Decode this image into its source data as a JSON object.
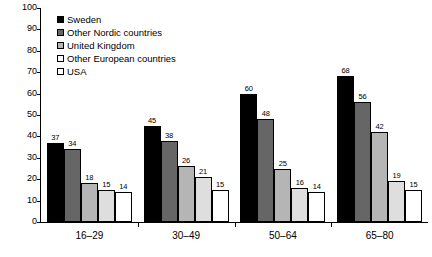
{
  "chart_data": {
    "type": "bar",
    "title": "",
    "subtitle": "",
    "xlabel": "",
    "ylabel": "",
    "ylim": [
      0,
      100
    ],
    "y_ticks": [
      0,
      10,
      20,
      30,
      40,
      50,
      60,
      70,
      80,
      90,
      100
    ],
    "grid": false,
    "legend_position": "top-left",
    "categories": [
      "16–29",
      "30–49",
      "50–64",
      "65–80"
    ],
    "series": [
      {
        "name": "Sweden",
        "color": "#000000",
        "values": [
          37,
          45,
          60,
          68
        ]
      },
      {
        "name": "Other Nordic countries",
        "color": "#666666",
        "values": [
          34,
          38,
          48,
          56
        ]
      },
      {
        "name": "United Kingdom",
        "color": "#b5b5b5",
        "values": [
          18,
          26,
          25,
          42
        ]
      },
      {
        "name": "Other European countries",
        "color": "#dedede",
        "values": [
          15,
          21,
          16,
          19
        ]
      },
      {
        "name": "USA",
        "color": "#ffffff",
        "values": [
          14,
          15,
          14,
          15
        ]
      }
    ]
  },
  "axes": {
    "y_tick_labels": [
      "100",
      "90",
      "80",
      "70",
      "60",
      "50",
      "40",
      "30",
      "20",
      "10",
      "0"
    ],
    "x_tick_labels": [
      "16–29",
      "30–49",
      "50–64",
      "65–80"
    ]
  },
  "legend": {
    "items": [
      {
        "label": "Sweden",
        "color": "#000000"
      },
      {
        "label": "Other Nordic countries",
        "color": "#666666"
      },
      {
        "label": "United Kingdom",
        "color": "#b5b5b5"
      },
      {
        "label": "Other European countries",
        "color": "#ffffff"
      },
      {
        "label": "USA",
        "color": "#ffffff"
      }
    ]
  },
  "data_labels": {
    "group_16_29": [
      "37",
      "34",
      "18",
      "15",
      "14"
    ],
    "group_30_49": [
      "45",
      "38",
      "26",
      "21",
      "15"
    ],
    "group_50_64": [
      "60",
      "48",
      "25",
      "16",
      "14"
    ],
    "group_65_80": [
      "68",
      "56",
      "42",
      "19",
      "15"
    ]
  }
}
